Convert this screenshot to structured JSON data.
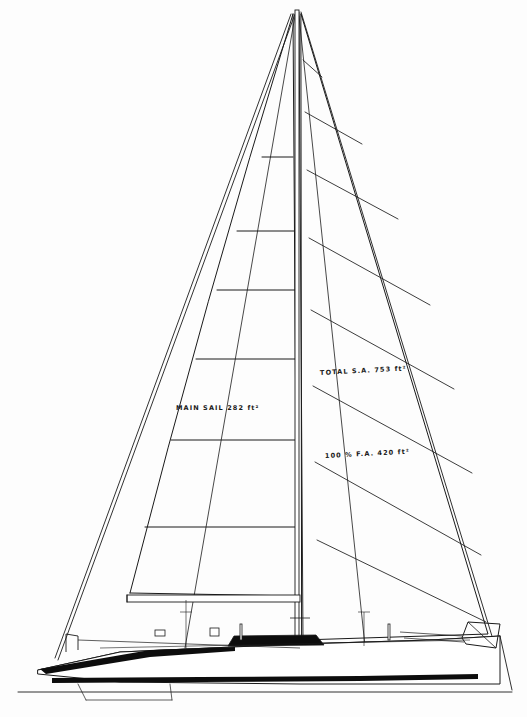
{
  "drawing": {
    "kind": "sailboat-sail-plan",
    "title": "Masthead Sloop Sail Plan",
    "paper_color": "#fdfdfd",
    "ink_color": "#1a1a1a",
    "accent_dark": "#0d0d0d"
  },
  "annotations": [
    {
      "name": "mainsail-area-label",
      "text": "MAIN SAIL  282 ft²",
      "x": 176,
      "y": 404,
      "rotate": 0
    },
    {
      "name": "total-sail-area-label",
      "text": "TOTAL S.A.  753 ft²",
      "x": 320,
      "y": 369,
      "rotate": -3
    },
    {
      "name": "foretriangle-area-label",
      "text": "100 % F.A.  420 ft²",
      "x": 325,
      "y": 452,
      "rotate": -3
    }
  ],
  "chart_data": {
    "type": "line",
    "xlabel": "",
    "ylabel": "",
    "masthead": {
      "x": 297,
      "y": 8
    },
    "mast": {
      "top_y": 10,
      "base_y": 648,
      "x": 297,
      "width": 4
    },
    "boom": {
      "x1": 127,
      "x2": 300,
      "y": 595,
      "depth": 7
    },
    "mainsail": {
      "head": [
        293,
        14
      ],
      "tack": [
        130,
        593
      ],
      "clew": [
        299,
        596
      ],
      "leech_control": [
        205,
        300
      ],
      "battens_y": [
        157,
        231,
        290,
        359,
        440,
        527
      ],
      "batten_left_x": [
        262,
        237,
        217,
        196,
        171,
        145
      ],
      "batten_right_x": [
        293,
        294,
        295,
        296,
        296,
        297
      ]
    },
    "genoa": {
      "head": [
        301,
        14
      ],
      "tack": [
        302,
        640
      ],
      "clew": [
        488,
        634
      ],
      "seams": [
        {
          "x1": 303,
          "y1": 60,
          "x2": 322,
          "y2": 77
        },
        {
          "x1": 305,
          "y1": 112,
          "x2": 362,
          "y2": 144
        },
        {
          "x1": 307,
          "y1": 170,
          "x2": 398,
          "y2": 219
        },
        {
          "x1": 309,
          "y1": 238,
          "x2": 430,
          "y2": 305
        },
        {
          "x1": 311,
          "y1": 310,
          "x2": 454,
          "y2": 389
        },
        {
          "x1": 313,
          "y1": 386,
          "x2": 472,
          "y2": 473
        },
        {
          "x1": 315,
          "y1": 462,
          "x2": 481,
          "y2": 555
        },
        {
          "x1": 317,
          "y1": 540,
          "x2": 486,
          "y2": 622
        }
      ]
    },
    "rigging": {
      "forestay": [
        [
          299,
          12
        ],
        [
          303,
          640
        ]
      ],
      "backstay": [
        [
          301,
          12
        ],
        [
          495,
          646
        ]
      ],
      "headstay_front": [
        [
          291,
          14
        ],
        [
          55,
          658
        ]
      ],
      "jibstay_luff": [
        [
          295,
          14
        ],
        [
          58,
          660
        ]
      ],
      "shrouds": [
        [
          [
            295,
            16
          ],
          [
            185,
            648
          ]
        ],
        [
          [
            299,
            16
          ],
          [
            365,
            646
          ]
        ]
      ]
    },
    "hull": {
      "waterline_y": 690,
      "sheer_line": [
        [
          38,
          670
        ],
        [
          120,
          652
        ],
        [
          300,
          644
        ],
        [
          430,
          640
        ],
        [
          500,
          636
        ]
      ],
      "bow_x": 38,
      "stern_x": 500,
      "keel_bottom_y": 684,
      "boot_stripe_y": 676,
      "boot_stripe_height": 5
    },
    "deck_hardware": [
      {
        "name": "bow-pulpit",
        "x": 66,
        "y": 634,
        "w": 12,
        "h": 18
      },
      {
        "name": "forward-hatch",
        "x": 155,
        "y": 630,
        "w": 10,
        "h": 6
      },
      {
        "name": "mast-winch",
        "x": 210,
        "y": 628,
        "w": 9,
        "h": 8
      },
      {
        "name": "cabin-trunk",
        "x": 228,
        "y": 636,
        "w": 96,
        "h": 10
      },
      {
        "name": "stanchion-mid",
        "x": 240,
        "y": 624,
        "w": 2,
        "h": 16
      },
      {
        "name": "stanchion-aft",
        "x": 388,
        "y": 624,
        "w": 2,
        "h": 16
      },
      {
        "name": "stern-pulpit",
        "x": 462,
        "y": 622,
        "w": 38,
        "h": 26
      }
    ]
  }
}
